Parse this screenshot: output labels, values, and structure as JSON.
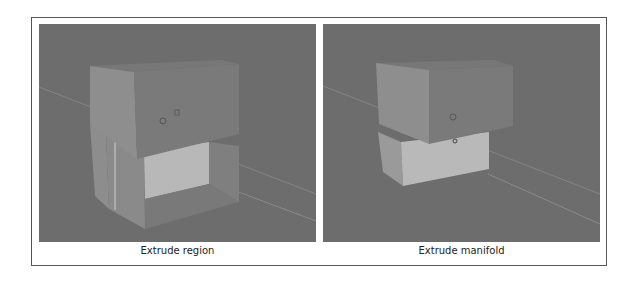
{
  "figure": {
    "panels": [
      {
        "caption": "Extrude region",
        "viewport": "3d-viewport-gray"
      },
      {
        "caption": "Extrude manifold",
        "viewport": "3d-viewport-gray"
      }
    ],
    "colors": {
      "viewport_bg": "#6d6d6d",
      "face_top": "#777777",
      "face_side_light": "#8e8e8e",
      "face_front": "#7a7a7a",
      "face_inner_light": "#b8b8b8",
      "border": "#555555"
    }
  }
}
